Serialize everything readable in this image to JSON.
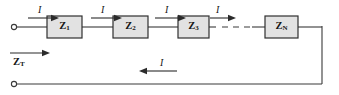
{
  "diagram": {
    "type": "circuit-schematic",
    "width": 339,
    "height": 95,
    "background_color": "#ffffff",
    "wire_color": "#3a3a3a",
    "box_fill_color": "#e2e2e2",
    "box_stroke_color": "#2f2f2f",
    "text_color": "#151515"
  },
  "impedances": [
    {
      "id": "z1",
      "symbol": "Z",
      "subscript": "1",
      "x": 47,
      "y": 16,
      "w": 35,
      "h": 22
    },
    {
      "id": "z2",
      "symbol": "Z",
      "subscript": "2",
      "x": 113,
      "y": 16,
      "w": 35,
      "h": 22
    },
    {
      "id": "z3",
      "symbol": "Z",
      "subscript": "3",
      "x": 178,
      "y": 16,
      "w": 31,
      "h": 22
    },
    {
      "id": "zn",
      "symbol": "Z",
      "subscript": "N",
      "x": 265,
      "y": 16,
      "w": 33,
      "h": 22
    }
  ],
  "current_labels": [
    {
      "id": "i-in",
      "text": "I",
      "x": 34,
      "y": 4,
      "direction": "right"
    },
    {
      "id": "i-12",
      "text": "I",
      "x": 96,
      "y": 4,
      "direction": "right"
    },
    {
      "id": "i-23",
      "text": "I",
      "x": 160,
      "y": 4,
      "direction": "right"
    },
    {
      "id": "i-3n",
      "text": "I",
      "x": 215,
      "y": 4,
      "direction": "right"
    },
    {
      "id": "i-return",
      "text": "I",
      "x": 157,
      "y": 60,
      "direction": "left"
    }
  ],
  "total_impedance": {
    "symbol": "Z",
    "subscript": "T",
    "label_x": 12,
    "label_y": 57,
    "arrow_direction": "right"
  },
  "terminals": [
    {
      "id": "terminal-top",
      "x": 14,
      "y": 27,
      "r": 2.6
    },
    {
      "id": "terminal-bottom",
      "x": 14,
      "y": 84,
      "r": 2.6
    }
  ],
  "wires": {
    "top_segments": [
      {
        "id": "seg-in-z1",
        "x1": 17,
        "y1": 27,
        "x2": 47,
        "y2": 27
      },
      {
        "id": "seg-z1-z2",
        "x1": 82,
        "y1": 27,
        "x2": 113,
        "y2": 27
      },
      {
        "id": "seg-z2-z3",
        "x1": 148,
        "y1": 27,
        "x2": 178,
        "y2": 27
      },
      {
        "id": "seg-z3-dash",
        "x1": 209,
        "y1": 27,
        "x2": 215,
        "y2": 27
      },
      {
        "id": "seg-dash-zn",
        "x1": 249,
        "y1": 27,
        "x2": 265,
        "y2": 27
      },
      {
        "id": "seg-zn-right",
        "x1": 298,
        "y1": 27,
        "x2": 322,
        "y2": 27
      }
    ],
    "dashed_segment": {
      "id": "seg-ellipsis",
      "x1": 222,
      "y1": 27,
      "x2": 250,
      "y2": 27
    },
    "return_path": {
      "id": "seg-return",
      "points": "322,27 322,84 17,84"
    }
  },
  "arrows": {
    "current_arrows": [
      {
        "id": "arrow-in",
        "x1": 28,
        "x2": 57,
        "y": 18,
        "direction": "right"
      },
      {
        "id": "arrow-12",
        "x1": 90,
        "x2": 119,
        "y": 18,
        "direction": "right"
      },
      {
        "id": "arrow-23",
        "x1": 154,
        "x2": 183,
        "y": 18,
        "direction": "right"
      },
      {
        "id": "arrow-3n",
        "x1": 209,
        "x2": 233,
        "y": 18,
        "direction": "right"
      },
      {
        "id": "arrow-return",
        "x1": 139,
        "x2": 175,
        "y": 71,
        "direction": "left"
      }
    ],
    "zt_arrow": {
      "id": "arrow-zt",
      "x1": 10,
      "x2": 48,
      "y": 53,
      "direction": "right"
    }
  }
}
